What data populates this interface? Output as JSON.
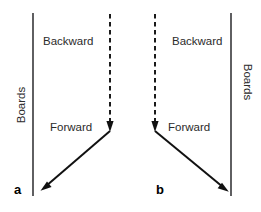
{
  "figure": {
    "panels": [
      {
        "id": "a",
        "label": "a",
        "boards_label": "Boards",
        "backward_label": "Backward",
        "forward_label": "Forward",
        "board_side": "left",
        "board_x": 33,
        "board_y_top": 13,
        "board_y_bottom": 196,
        "dashed_arrow": {
          "name": "backward-arrow",
          "x1": 110,
          "y1": 14,
          "x2": 110,
          "y2": 126,
          "direction": "down",
          "style": "dashed"
        },
        "solid_arrow": {
          "name": "forward-arrow",
          "x1": 110,
          "y1": 131,
          "x2": 41,
          "y2": 190,
          "direction": "down-left",
          "style": "solid"
        },
        "backward_text_pos": {
          "x": 43,
          "y": 45
        },
        "forward_text_pos": {
          "x": 50,
          "y": 131
        },
        "boards_text_pos": {
          "x": 25,
          "y": 105
        },
        "boards_rotation": -90,
        "panel_label_pos": {
          "x": 14,
          "y": 194
        }
      },
      {
        "id": "b",
        "label": "b",
        "boards_label": "Boards",
        "backward_label": "Backward",
        "forward_label": "Forward",
        "board_side": "right",
        "board_x": 231,
        "board_y_top": 13,
        "board_y_bottom": 196,
        "dashed_arrow": {
          "name": "backward-arrow",
          "x1": 155,
          "y1": 14,
          "x2": 155,
          "y2": 126,
          "direction": "down",
          "style": "dashed"
        },
        "solid_arrow": {
          "name": "forward-arrow",
          "x1": 155,
          "y1": 131,
          "x2": 228,
          "y2": 191,
          "direction": "down-right",
          "style": "solid"
        },
        "backward_text_pos": {
          "x": 172,
          "y": 45
        },
        "forward_text_pos": {
          "x": 168,
          "y": 131
        },
        "boards_text_pos": {
          "x": 244,
          "y": 82
        },
        "boards_rotation": 90,
        "panel_label_pos": {
          "x": 156,
          "y": 194
        }
      }
    ],
    "colors": {
      "board_stroke": "#58585a",
      "arrow_stroke": "#111111",
      "text": "#2b2b2b",
      "panel_label": "#000000",
      "background": "#ffffff"
    }
  }
}
